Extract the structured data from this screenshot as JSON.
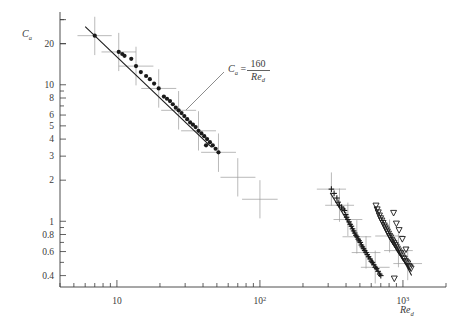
{
  "figure": {
    "background": "#ffffff",
    "ink": "#3a3a3a",
    "marker_color": "#1a1a1a",
    "grid": false
  },
  "chart_data": {
    "type": "scatter",
    "title": "",
    "subtitle": "",
    "xlabel": "Re_d",
    "ylabel": "C_a",
    "xscale": "log",
    "yscale": "log",
    "xlim": [
      4.0,
      2000.0
    ],
    "ylim": [
      0.33,
      33.0
    ],
    "xticklabels": [
      "10",
      "10^2",
      "10^3"
    ],
    "xtickvalues": [
      10,
      100,
      1000
    ],
    "yticklabels": [
      "20",
      "10",
      "8",
      "6",
      "5",
      "4",
      "3",
      "2",
      "1",
      "0.8",
      "0.6",
      "0.4"
    ],
    "ytickvalues": [
      20,
      10,
      8,
      6,
      5,
      4,
      3,
      2,
      1,
      0.8,
      0.6,
      0.4
    ],
    "legend": [],
    "annotations": [
      {
        "name": "theory-line-label",
        "text_lhs": "C",
        "text_lhs_sub": "a",
        "text_eq": "=",
        "numerator": "160",
        "denominator": "Re",
        "denominator_sub": "d",
        "x": 228,
        "y": 68,
        "leader_from": [
          224,
          72
        ],
        "leader_to": [
          186,
          110
        ]
      }
    ],
    "fit_lines": [
      {
        "name": "theory-160-over-Red",
        "x": [
          6.0,
          46.0
        ],
        "y": [
          26.7,
          3.48
        ],
        "slope": -1
      },
      {
        "name": "plus-series-fit",
        "x": [
          310.0,
          700.0
        ],
        "y": [
          1.62,
          0.4
        ]
      },
      {
        "name": "triangle-series-fit",
        "x": [
          640.0,
          1150.0
        ],
        "y": [
          1.28,
          0.4
        ]
      }
    ],
    "series": [
      {
        "name": "filled-circle-series",
        "marker": "filled-circle",
        "x": [
          7.0,
          10.3,
          10.9,
          11.3,
          12.6,
          13.6,
          14.7,
          16.0,
          17.0,
          18.2,
          19.6,
          21.3,
          22.4,
          23.5,
          24.6,
          25.8,
          27.0,
          28.3,
          29.6,
          31.0,
          32.5,
          34.0,
          35.5,
          37.2,
          39.0,
          40.8,
          42.7,
          44.7,
          46.8,
          49.0,
          51.3,
          42.0
        ],
        "y": [
          22.9,
          17.4,
          16.8,
          16.3,
          15.5,
          13.7,
          12.4,
          11.6,
          11.0,
          10.2,
          9.4,
          8.2,
          7.9,
          7.6,
          7.2,
          6.8,
          6.5,
          6.2,
          5.9,
          5.6,
          5.3,
          5.1,
          4.9,
          4.6,
          4.4,
          4.2,
          4.0,
          3.8,
          3.6,
          3.4,
          3.2,
          3.6
        ]
      },
      {
        "name": "plus-series",
        "marker": "plus",
        "x": [
          316,
          330,
          345,
          352,
          360,
          372,
          381,
          390,
          398,
          404,
          412,
          420,
          428,
          436,
          444,
          452,
          460,
          468,
          476,
          486,
          494,
          503,
          512,
          520,
          530,
          540,
          552,
          563,
          575,
          588,
          600,
          612,
          625,
          640,
          655,
          670,
          688,
          700
        ],
        "y": [
          1.72,
          1.6,
          1.48,
          1.38,
          1.31,
          1.27,
          1.23,
          1.2,
          1.12,
          1.07,
          1.03,
          0.99,
          0.95,
          0.92,
          0.88,
          0.85,
          0.82,
          0.79,
          0.77,
          0.74,
          0.72,
          0.7,
          0.67,
          0.65,
          0.63,
          0.61,
          0.59,
          0.57,
          0.55,
          0.53,
          0.51,
          0.5,
          0.48,
          0.46,
          0.45,
          0.43,
          0.41,
          0.4
        ]
      },
      {
        "name": "open-triangle-series",
        "marker": "open-triangle-down",
        "x": [
          648,
          660,
          672,
          685,
          698,
          712,
          726,
          740,
          752,
          765,
          778,
          792,
          806,
          820,
          835,
          850,
          866,
          882,
          898,
          914,
          930,
          948,
          966,
          984,
          1002,
          1020,
          1040,
          1060,
          1080,
          1100,
          1120,
          1140,
          860,
          900,
          940,
          990,
          1050,
          870
        ],
        "y": [
          1.3,
          1.22,
          1.16,
          1.1,
          1.05,
          1.01,
          0.97,
          0.93,
          0.9,
          0.87,
          0.84,
          0.81,
          0.78,
          0.76,
          0.73,
          0.71,
          0.69,
          0.67,
          0.65,
          0.63,
          0.61,
          0.59,
          0.58,
          0.56,
          0.54,
          0.53,
          0.51,
          0.5,
          0.49,
          0.47,
          0.46,
          0.45,
          1.15,
          0.96,
          0.86,
          0.74,
          0.62,
          0.38
        ]
      }
    ],
    "error_bars": [
      {
        "x": 7.0,
        "y": 22.9,
        "xlo": 5.3,
        "xhi": 9.2,
        "ylo": 16.5,
        "yhi": 31.5
      },
      {
        "x": 10.3,
        "y": 17.4,
        "xlo": 7.8,
        "xhi": 13.6,
        "ylo": 12.6,
        "yhi": 24.0
      },
      {
        "x": 13.6,
        "y": 13.7,
        "xlo": 10.3,
        "xhi": 18.0,
        "ylo": 9.9,
        "yhi": 19.0
      },
      {
        "x": 19.6,
        "y": 9.4,
        "xlo": 14.8,
        "xhi": 26.0,
        "ylo": 6.8,
        "yhi": 13.0
      },
      {
        "x": 27.0,
        "y": 6.5,
        "xlo": 20.4,
        "xhi": 35.8,
        "ylo": 4.7,
        "yhi": 9.0
      },
      {
        "x": 37.2,
        "y": 4.6,
        "xlo": 28.1,
        "xhi": 49.3,
        "ylo": 3.3,
        "yhi": 6.4
      },
      {
        "x": 51.3,
        "y": 3.2,
        "xlo": 38.8,
        "xhi": 68.0,
        "ylo": 2.3,
        "yhi": 4.4
      },
      {
        "x": 70.0,
        "y": 2.1,
        "xlo": 53.0,
        "xhi": 93.0,
        "ylo": 1.52,
        "yhi": 2.9
      },
      {
        "x": 100.0,
        "y": 1.45,
        "xlo": 75.0,
        "xhi": 133.0,
        "ylo": 1.05,
        "yhi": 2.0
      },
      {
        "x": 316.0,
        "y": 1.72,
        "xlo": 250.0,
        "xhi": 400.0,
        "ylo": 1.3,
        "yhi": 2.28
      },
      {
        "x": 360.0,
        "y": 1.31,
        "xlo": 286.0,
        "xhi": 455.0,
        "ylo": 0.99,
        "yhi": 1.74
      },
      {
        "x": 412.0,
        "y": 1.03,
        "xlo": 327.0,
        "xhi": 520.0,
        "ylo": 0.78,
        "yhi": 1.37
      },
      {
        "x": 476.0,
        "y": 0.77,
        "xlo": 378.0,
        "xhi": 600.0,
        "ylo": 0.58,
        "yhi": 1.02
      },
      {
        "x": 552.0,
        "y": 0.59,
        "xlo": 438.0,
        "xhi": 696.0,
        "ylo": 0.45,
        "yhi": 0.78
      },
      {
        "x": 640.0,
        "y": 0.46,
        "xlo": 508.0,
        "xhi": 807.0,
        "ylo": 0.35,
        "yhi": 0.61
      },
      {
        "x": 806.0,
        "y": 0.78,
        "xlo": 640.0,
        "xhi": 1016.0,
        "ylo": 0.59,
        "yhi": 1.03
      },
      {
        "x": 930.0,
        "y": 0.61,
        "xlo": 738.0,
        "xhi": 1172.0,
        "ylo": 0.46,
        "yhi": 0.81
      },
      {
        "x": 1080.0,
        "y": 0.49,
        "xlo": 857.0,
        "xhi": 1360.0,
        "ylo": 0.37,
        "yhi": 0.65
      }
    ]
  }
}
